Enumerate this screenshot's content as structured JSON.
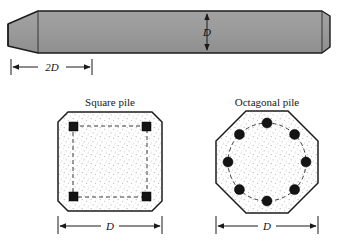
{
  "figure": {
    "elevation": {
      "name": "tapered pile elevation",
      "dimensions": [
        {
          "id": "taper_length",
          "label": "2D",
          "orientation": "horizontal"
        },
        {
          "id": "shaft_width",
          "label": "D",
          "orientation": "vertical"
        }
      ],
      "fill_color": "#9a9a9a",
      "outline_color": "#1c1c1c"
    },
    "sections": [
      {
        "id": "square",
        "caption": "Square pile",
        "shape": "square-with-chamfered-corners",
        "rebar_count": 4,
        "rebar_shape": "square",
        "dimension": {
          "label": "D",
          "orientation": "horizontal"
        },
        "tie_style": "dashed-rectangle",
        "fill_color": "#ffffff",
        "stipple_color": "#b9b9b9"
      },
      {
        "id": "octagonal",
        "caption": "Octagonal pile",
        "shape": "regular-octagon",
        "rebar_count": 8,
        "rebar_shape": "circle",
        "dimension": {
          "label": "D",
          "orientation": "horizontal"
        },
        "tie_style": "dashed-circle",
        "fill_color": "#ffffff",
        "stipple_color": "#b9b9b9"
      }
    ]
  }
}
